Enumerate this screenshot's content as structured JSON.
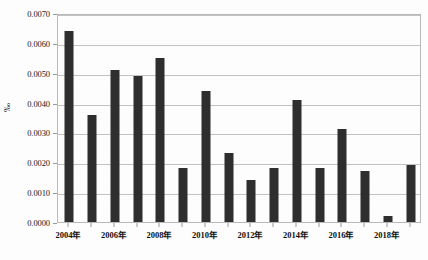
{
  "chart_data": {
    "type": "bar",
    "title": "",
    "subtitle": "",
    "xlabel": "",
    "ylabel": "‰",
    "ylim": [
      0.0,
      0.007
    ],
    "ytick_step": 0.001,
    "ytick_labels": [
      "0.0000",
      "0.0010",
      "0.0020",
      "0.0030",
      "0.0040",
      "0.0050",
      "0.0060",
      "0.0070"
    ],
    "ytick_values": [
      0.0,
      0.001,
      0.002,
      0.003,
      0.004,
      0.005,
      0.006,
      0.007
    ],
    "grid": "horizontal",
    "legend": "none",
    "bar_color": "#2e2e2e",
    "grid_color": "#c2c2c2",
    "border_color": "#b9b9b9",
    "categories": [
      "2004年",
      "2005年",
      "2006年",
      "2007年",
      "2008年",
      "2009年",
      "2010年",
      "2011年",
      "2012年",
      "2013年",
      "2014年",
      "2015年",
      "2016年",
      "2017年",
      "2018年",
      "2019年"
    ],
    "xtick_labels_shown": [
      "2004年",
      "2006年",
      "2008年",
      "2010年",
      "2012年",
      "2014年",
      "2016年",
      "2018年"
    ],
    "values": [
      0.0064,
      0.0036,
      0.0051,
      0.0049,
      0.0055,
      0.0018,
      0.0044,
      0.0023,
      0.0014,
      0.0018,
      0.0041,
      0.0018,
      0.0031,
      0.0017,
      0.0002,
      0.0019
    ],
    "series": [
      {
        "name": "",
        "values": [
          0.0064,
          0.0036,
          0.0051,
          0.0049,
          0.0055,
          0.0018,
          0.0044,
          0.0023,
          0.0014,
          0.0018,
          0.0041,
          0.0018,
          0.0031,
          0.0017,
          0.0002,
          0.0019
        ]
      }
    ]
  }
}
